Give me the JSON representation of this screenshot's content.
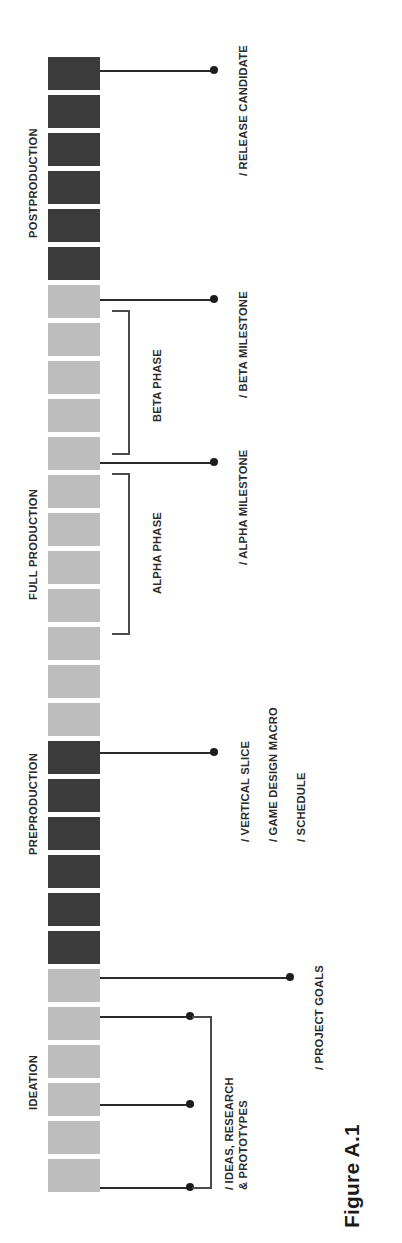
{
  "figure": {
    "caption": "Figure A.1",
    "colors": {
      "dark_block": "#3b3b3b",
      "light_block": "#bdbdbd",
      "line": "#2b2b2b",
      "bracket": "#4a4a4a",
      "background": "#ffffff"
    }
  },
  "chart_data": {
    "type": "table",
    "title": "Figure A.1",
    "block_count": 30,
    "block_legend": [
      {
        "shade": "dark",
        "color": "#3b3b3b"
      },
      {
        "shade": "light",
        "color": "#bdbdbd"
      }
    ],
    "blocks": [
      {
        "index": 0,
        "shade": "dark"
      },
      {
        "index": 1,
        "shade": "dark"
      },
      {
        "index": 2,
        "shade": "dark"
      },
      {
        "index": 3,
        "shade": "dark"
      },
      {
        "index": 4,
        "shade": "dark"
      },
      {
        "index": 5,
        "shade": "dark"
      },
      {
        "index": 6,
        "shade": "light"
      },
      {
        "index": 7,
        "shade": "light"
      },
      {
        "index": 8,
        "shade": "light"
      },
      {
        "index": 9,
        "shade": "light"
      },
      {
        "index": 10,
        "shade": "light"
      },
      {
        "index": 11,
        "shade": "light"
      },
      {
        "index": 12,
        "shade": "light"
      },
      {
        "index": 13,
        "shade": "light"
      },
      {
        "index": 14,
        "shade": "light"
      },
      {
        "index": 15,
        "shade": "light"
      },
      {
        "index": 16,
        "shade": "light"
      },
      {
        "index": 17,
        "shade": "light"
      },
      {
        "index": 18,
        "shade": "dark"
      },
      {
        "index": 19,
        "shade": "dark"
      },
      {
        "index": 20,
        "shade": "dark"
      },
      {
        "index": 21,
        "shade": "dark"
      },
      {
        "index": 22,
        "shade": "dark"
      },
      {
        "index": 23,
        "shade": "dark"
      },
      {
        "index": 24,
        "shade": "light"
      },
      {
        "index": 25,
        "shade": "light"
      },
      {
        "index": 26,
        "shade": "light"
      },
      {
        "index": 27,
        "shade": "light"
      },
      {
        "index": 28,
        "shade": "light"
      },
      {
        "index": 29,
        "shade": "light"
      }
    ],
    "stages": [
      {
        "name": "POSTPRODUCTION",
        "blocks": [
          0,
          5
        ]
      },
      {
        "name": "FULL PRODUCTION",
        "blocks": [
          6,
          17
        ]
      },
      {
        "name": "PREPRODUCTION",
        "blocks": [
          18,
          23
        ]
      },
      {
        "name": "IDEATION",
        "blocks": [
          24,
          29
        ]
      }
    ],
    "phases": [
      {
        "name": "BETA PHASE",
        "blocks": [
          6,
          11
        ]
      },
      {
        "name": "ALPHA PHASE",
        "blocks": [
          12,
          17
        ]
      }
    ],
    "milestones": [
      {
        "name": "/ RELEASE CANDIDATE",
        "at_block": 0
      },
      {
        "name": "/ BETA MILESTONE",
        "at_block": 6
      },
      {
        "name": "/ ALPHA MILESTONE",
        "at_block": 12
      },
      {
        "name": "/ VERTICAL SLICE",
        "at_block": 18
      },
      {
        "name": "/ GAME DESIGN MACRO",
        "at_block": 18
      },
      {
        "name": "/ SCHEDULE",
        "at_block": 18
      },
      {
        "name": "/ PROJECT GOALS",
        "at_block": 24
      },
      {
        "name": "/ IDEAS, RESEARCH\n& PROTOTYPES",
        "at_block": 25
      }
    ]
  },
  "stage_labels": {
    "postproduction": "POSTPRODUCTION",
    "full_production": "FULL PRODUCTION",
    "preproduction": "PREPRODUCTION",
    "ideation": "IDEATION"
  },
  "phase_labels": {
    "beta_phase": "BETA PHASE",
    "alpha_phase": "ALPHA PHASE"
  },
  "milestone_labels": {
    "release_candidate": "/ RELEASE CANDIDATE",
    "beta_milestone": "/ BETA MILESTONE",
    "alpha_milestone": "/ ALPHA MILESTONE",
    "vertical_slice": "/ VERTICAL SLICE",
    "game_design_macro": "/ GAME DESIGN MACRO",
    "schedule": "/ SCHEDULE",
    "project_goals": "/ PROJECT GOALS",
    "ideas_research_prototypes": "/ IDEAS, RESEARCH\n& PROTOTYPES"
  }
}
